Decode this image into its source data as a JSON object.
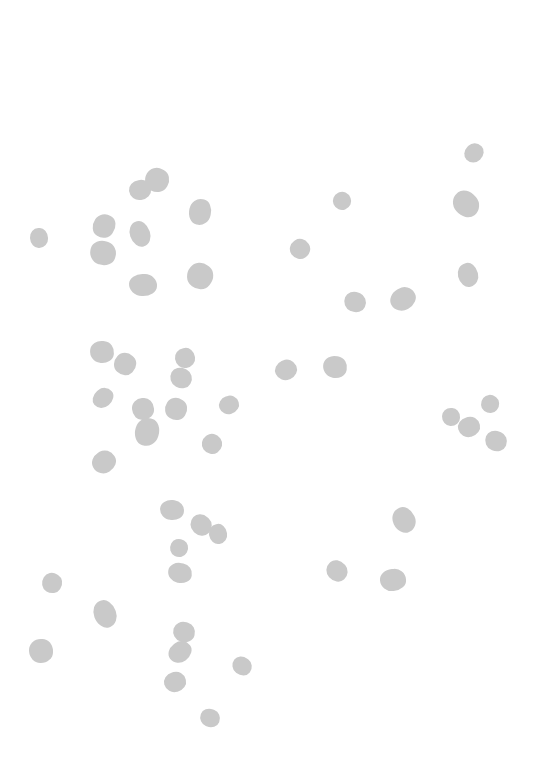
{
  "image": {
    "description": "Scattered gray particle blobs on a white background",
    "background_color": "#ffffff",
    "blob_color": "#c9c9c9",
    "blobs": [
      {
        "x": 474,
        "y": 153,
        "w": 20,
        "h": 18
      },
      {
        "x": 140,
        "y": 190,
        "w": 22,
        "h": 20
      },
      {
        "x": 157,
        "y": 180,
        "w": 24,
        "h": 24
      },
      {
        "x": 342,
        "y": 201,
        "w": 18,
        "h": 18
      },
      {
        "x": 200,
        "y": 212,
        "w": 22,
        "h": 26
      },
      {
        "x": 466,
        "y": 204,
        "w": 24,
        "h": 28
      },
      {
        "x": 39,
        "y": 238,
        "w": 18,
        "h": 20
      },
      {
        "x": 104,
        "y": 226,
        "w": 22,
        "h": 24
      },
      {
        "x": 140,
        "y": 234,
        "w": 20,
        "h": 26
      },
      {
        "x": 103,
        "y": 253,
        "w": 26,
        "h": 24
      },
      {
        "x": 300,
        "y": 249,
        "w": 20,
        "h": 20
      },
      {
        "x": 143,
        "y": 285,
        "w": 28,
        "h": 22
      },
      {
        "x": 200,
        "y": 276,
        "w": 26,
        "h": 26
      },
      {
        "x": 468,
        "y": 275,
        "w": 20,
        "h": 24
      },
      {
        "x": 355,
        "y": 302,
        "w": 22,
        "h": 20
      },
      {
        "x": 403,
        "y": 299,
        "w": 26,
        "h": 22
      },
      {
        "x": 102,
        "y": 352,
        "w": 24,
        "h": 22
      },
      {
        "x": 125,
        "y": 364,
        "w": 22,
        "h": 22
      },
      {
        "x": 185,
        "y": 358,
        "w": 20,
        "h": 20
      },
      {
        "x": 181,
        "y": 378,
        "w": 22,
        "h": 20
      },
      {
        "x": 286,
        "y": 370,
        "w": 22,
        "h": 20
      },
      {
        "x": 335,
        "y": 367,
        "w": 24,
        "h": 22
      },
      {
        "x": 103,
        "y": 398,
        "w": 22,
        "h": 18
      },
      {
        "x": 143,
        "y": 409,
        "w": 22,
        "h": 22
      },
      {
        "x": 176,
        "y": 409,
        "w": 22,
        "h": 22
      },
      {
        "x": 229,
        "y": 405,
        "w": 20,
        "h": 18
      },
      {
        "x": 147,
        "y": 432,
        "w": 24,
        "h": 28
      },
      {
        "x": 212,
        "y": 444,
        "w": 20,
        "h": 20
      },
      {
        "x": 451,
        "y": 417,
        "w": 18,
        "h": 18
      },
      {
        "x": 490,
        "y": 404,
        "w": 18,
        "h": 18
      },
      {
        "x": 469,
        "y": 427,
        "w": 22,
        "h": 20
      },
      {
        "x": 496,
        "y": 441,
        "w": 22,
        "h": 20
      },
      {
        "x": 104,
        "y": 462,
        "w": 24,
        "h": 22
      },
      {
        "x": 172,
        "y": 510,
        "w": 24,
        "h": 20
      },
      {
        "x": 201,
        "y": 525,
        "w": 22,
        "h": 20
      },
      {
        "x": 218,
        "y": 534,
        "w": 18,
        "h": 20
      },
      {
        "x": 179,
        "y": 548,
        "w": 18,
        "h": 18
      },
      {
        "x": 404,
        "y": 520,
        "w": 22,
        "h": 26
      },
      {
        "x": 180,
        "y": 573,
        "w": 24,
        "h": 20
      },
      {
        "x": 337,
        "y": 571,
        "w": 20,
        "h": 22
      },
      {
        "x": 393,
        "y": 580,
        "w": 26,
        "h": 22
      },
      {
        "x": 52,
        "y": 583,
        "w": 20,
        "h": 20
      },
      {
        "x": 105,
        "y": 614,
        "w": 22,
        "h": 28
      },
      {
        "x": 184,
        "y": 632,
        "w": 22,
        "h": 20
      },
      {
        "x": 180,
        "y": 652,
        "w": 24,
        "h": 20
      },
      {
        "x": 41,
        "y": 651,
        "w": 24,
        "h": 24
      },
      {
        "x": 242,
        "y": 666,
        "w": 20,
        "h": 18
      },
      {
        "x": 175,
        "y": 682,
        "w": 22,
        "h": 20
      },
      {
        "x": 210,
        "y": 718,
        "w": 20,
        "h": 18
      }
    ]
  }
}
